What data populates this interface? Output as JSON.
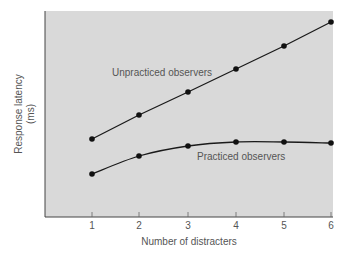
{
  "chart_data": {
    "type": "line",
    "title": "",
    "xlabel": "Number of distracters",
    "ylabel": "Response latency",
    "ylabel_unit": "(ms)",
    "x": [
      1,
      2,
      3,
      4,
      5,
      6
    ],
    "xticks": [
      "1",
      "2",
      "3",
      "4",
      "5",
      "6"
    ],
    "yticks": [],
    "grid": false,
    "series": [
      {
        "name": "Unpracticed observers",
        "values": [
          3.6,
          4.7,
          5.8,
          6.9,
          8.0,
          9.1
        ],
        "pixels": [
          [
            92,
            139
          ],
          [
            139,
            115
          ],
          [
            188,
            92
          ],
          [
            236,
            69
          ],
          [
            284,
            46
          ],
          [
            331,
            22
          ]
        ],
        "label_pos": [
          112,
          76
        ]
      },
      {
        "name": "Practiced observers",
        "values": [
          1.9,
          2.8,
          3.2,
          3.4,
          3.4,
          3.35
        ],
        "pixels": [
          [
            92,
            174
          ],
          [
            139,
            156
          ],
          [
            188,
            146
          ],
          [
            236,
            142
          ],
          [
            284,
            142
          ],
          [
            331,
            143
          ]
        ],
        "label_pos": [
          197,
          160
        ]
      }
    ],
    "legend_position": "inline-annotations",
    "colors": {
      "plot_background": "#d8d8d8",
      "line": "#1a1a1a",
      "axis": "#555555",
      "text": "#555555"
    }
  }
}
